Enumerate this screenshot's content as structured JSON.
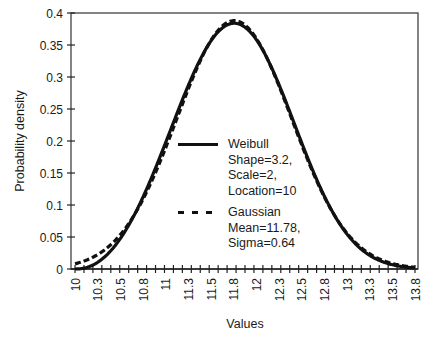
{
  "chart_data": {
    "type": "line",
    "title": "",
    "xlabel": "Values",
    "ylabel": "Probability density",
    "xlim": [
      10,
      13.8
    ],
    "ylim": [
      0,
      0.4
    ],
    "grid": false,
    "legend_position": "center-left inside plot",
    "x_tick_labels": [
      "10",
      "10.3",
      "10.5",
      "10.8",
      "11",
      "11.3",
      "11.5",
      "11.8",
      "12",
      "12.3",
      "12.5",
      "12.8",
      "13",
      "13.3",
      "13.5",
      "13.8"
    ],
    "y_tick_labels": [
      "0",
      "0.05",
      "0.1",
      "0.15",
      "0.2",
      "0.25",
      "0.3",
      "0.35",
      "0.4"
    ],
    "x": [
      10.0,
      10.2,
      10.4,
      10.6,
      10.8,
      11.0,
      11.2,
      11.4,
      11.6,
      11.8,
      12.0,
      12.2,
      12.4,
      12.6,
      12.8,
      13.0,
      13.2,
      13.4,
      13.6,
      13.8
    ],
    "series": [
      {
        "name": "Weibull",
        "params": {
          "shape": 3.2,
          "scale": 2,
          "location": 10
        },
        "style": "solid",
        "values": [
          0.0,
          0.002,
          0.012,
          0.034,
          0.069,
          0.117,
          0.176,
          0.24,
          0.302,
          0.35,
          0.383,
          0.384,
          0.356,
          0.302,
          0.232,
          0.16,
          0.098,
          0.052,
          0.024,
          0.009
        ]
      },
      {
        "name": "Gaussian",
        "params": {
          "mean": 11.78,
          "sigma": 0.64
        },
        "style": "dashed",
        "values": [
          0.008,
          0.019,
          0.038,
          0.07,
          0.118,
          0.18,
          0.25,
          0.32,
          0.37,
          0.388,
          0.37,
          0.32,
          0.25,
          0.18,
          0.118,
          0.07,
          0.038,
          0.019,
          0.008,
          0.003
        ]
      }
    ]
  },
  "legend": {
    "items": [
      {
        "label": "Weibull",
        "details": [
          "Shape=3.2,",
          "Scale=2,",
          "Location=10"
        ]
      },
      {
        "label": "Gaussian",
        "details": [
          "Mean=11.78,",
          "Sigma=0.64"
        ]
      }
    ]
  },
  "colors": {
    "line": "#111111",
    "axis": "#1a1a1a",
    "background": "#ffffff"
  }
}
